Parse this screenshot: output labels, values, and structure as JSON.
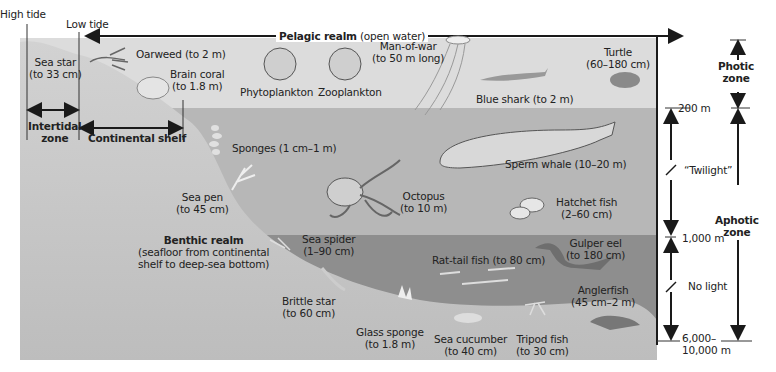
{
  "tides": {
    "high": "High tide",
    "low": "Low tide"
  },
  "realms": {
    "pelagic_bold": "Pelagic realm",
    "pelagic_note": "(open water)",
    "benthic_title": "Benthic realm",
    "benthic_note_1": "(seafloor from continental",
    "benthic_note_2": "shelf to deep-sea bottom)"
  },
  "zones": {
    "intertidal_1": "Intertidal",
    "intertidal_2": "zone",
    "continental_shelf": "Continental shelf",
    "photic_1": "Photic",
    "photic_2": "zone",
    "aphotic_1": "Aphotic",
    "aphotic_2": "zone",
    "twilight": "“Twilight”",
    "no_light": "No light"
  },
  "depths": {
    "d200": "200 m",
    "d1000": "1,000 m",
    "d6000_1": "6,000–",
    "d6000_2": "10,000 m"
  },
  "organisms": [
    {
      "name": "Sea star",
      "size": "(to 33 cm)"
    },
    {
      "name": "Oarweed (to 2 m)"
    },
    {
      "name": "Brain coral",
      "size": "(to 1.8 m)"
    },
    {
      "name": "Phytoplankton"
    },
    {
      "name": "Zooplankton"
    },
    {
      "name": "Man-of-war",
      "size": "(to 50 m long)"
    },
    {
      "name": "Turtle",
      "size": "(60–180 cm)"
    },
    {
      "name": "Blue shark (to 2 m)"
    },
    {
      "name": "Sponges (1 cm–1 m)"
    },
    {
      "name": "Sperm whale (10–20 m)"
    },
    {
      "name": "Sea pen",
      "size": "(to 45 cm)"
    },
    {
      "name": "Octopus",
      "size": "(to 10 m)"
    },
    {
      "name": "Hatchet fish",
      "size": "(2–60 cm)"
    },
    {
      "name": "Sea spider",
      "size": "(1–90 cm)"
    },
    {
      "name": "Gulper eel",
      "size": "(to 180 cm)"
    },
    {
      "name": "Rat-tail fish (to 80 cm)"
    },
    {
      "name": "Anglerfish",
      "size": "(45 cm–2 m)"
    },
    {
      "name": "Brittle star",
      "size": "(to 60 cm)"
    },
    {
      "name": "Glass sponge",
      "size": "(to 1.8 m)"
    },
    {
      "name": "Sea cucumber",
      "size": "(to 40 cm)"
    },
    {
      "name": "Tripod fish",
      "size": "(to 30 cm)"
    }
  ],
  "colors": {
    "photic_water": "#d9d9d9",
    "twilight_water": "#b4b4b4",
    "deep_water": "#8f8f8f",
    "land": "#c9c9c9",
    "line": "#1a1a1a"
  }
}
